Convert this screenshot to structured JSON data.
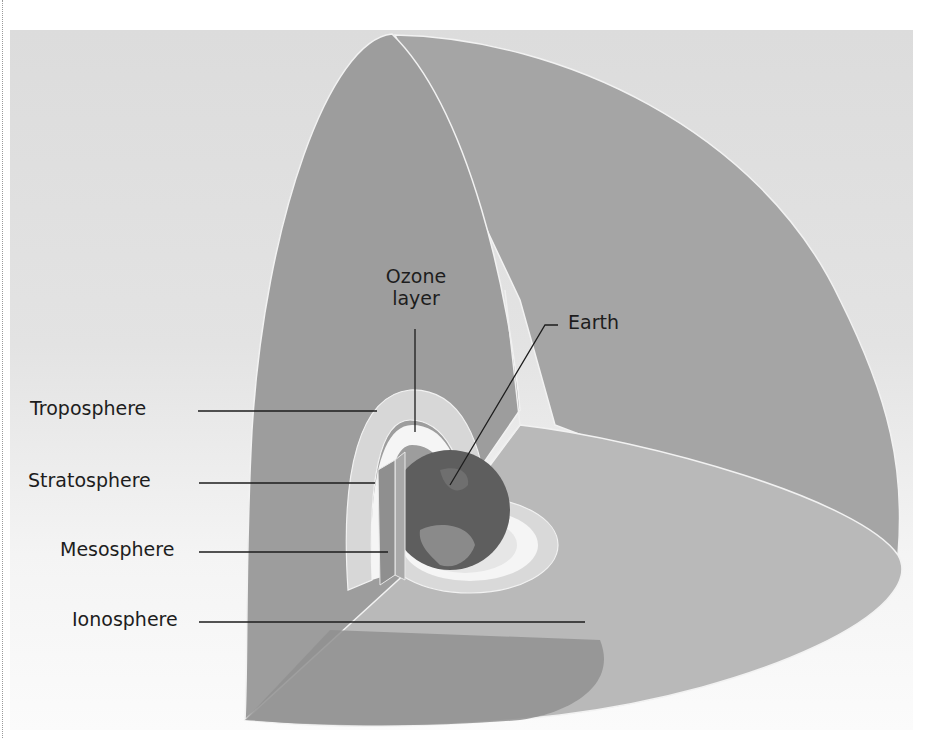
{
  "figure": {
    "labels": {
      "troposphere": "Troposphere",
      "stratosphere": "Stratosphere",
      "mesosphere": "Mesosphere",
      "ionosphere": "Ionosphere",
      "ozone_line1": "Ozone",
      "ozone_line2": "layer",
      "earth": "Earth"
    },
    "colors": {
      "background_top": "#dcdcdc",
      "background_bottom": "#fbfbfb",
      "shell_back_face": "#9c9c9c",
      "shell_right_face": "#a3a3a3",
      "shell_floor": "#b7b7b7",
      "shell_floor_front": "#8f8f8f",
      "inner_band_light": "#d9d9d9",
      "inner_band_white": "#f4f4f4",
      "earth": "#5f5f5f",
      "leader_line": "#1d1d1d",
      "edge_highlight": "#f2f2f2"
    }
  }
}
